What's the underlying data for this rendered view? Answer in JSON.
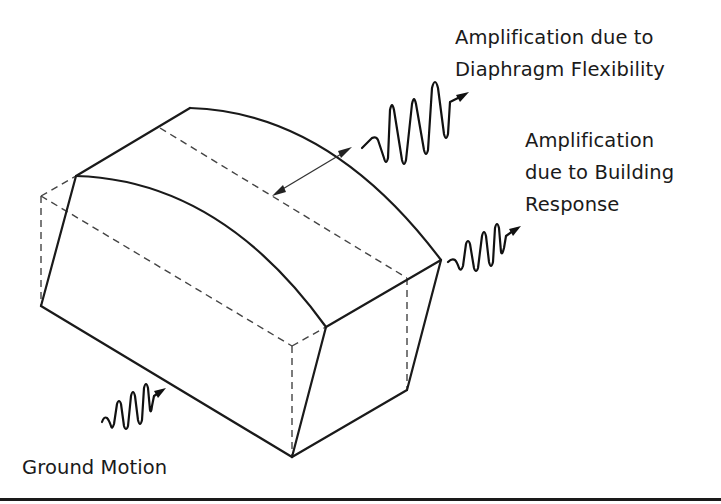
{
  "figure": {
    "type": "building amplification schematic",
    "labels": {
      "diaphragm": {
        "line1": "Amplification due to",
        "line2": "Diaphragm Flexibility"
      },
      "building": {
        "line1": "Amplification",
        "line2": "due to Building",
        "line3": "Response"
      },
      "ground": "Ground Motion"
    },
    "colors": {
      "stroke": "#1a1a1a",
      "background": "#ffffff"
    }
  }
}
